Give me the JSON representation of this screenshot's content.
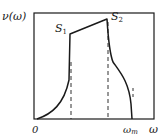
{
  "diagram": {
    "title": "",
    "y_axis_label": "ν(ω)",
    "x_axis_label": "ω",
    "origin_label": "0",
    "max_label": "ωm",
    "max_label_base": "ω",
    "max_label_sub": "m",
    "points": [
      {
        "name": "S1",
        "base": "S",
        "sub": "1"
      },
      {
        "name": "S2",
        "base": "S",
        "sub": "2"
      }
    ],
    "colors": {
      "line": "#1a1a1a",
      "background": "#ffffff"
    }
  }
}
